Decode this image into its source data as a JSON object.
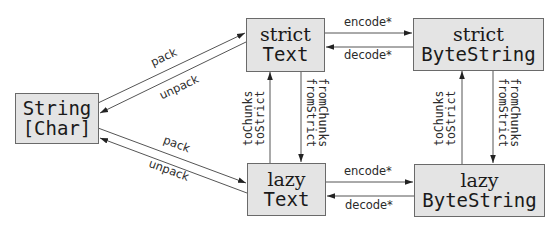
{
  "nodes": {
    "string_char": {
      "line1": "String",
      "line2": "[Char]"
    },
    "strict_text": {
      "line1": "strict",
      "line2": "Text"
    },
    "lazy_text": {
      "line1": "lazy",
      "line2": "Text"
    },
    "strict_bytestring": {
      "line1": "strict",
      "line2": "ByteString"
    },
    "lazy_bytestring": {
      "line1": "lazy",
      "line2": "ByteString"
    }
  },
  "edges": {
    "string_to_strict_text": "pack",
    "strict_text_to_string": "unpack",
    "string_to_lazy_text": "pack",
    "lazy_text_to_string": "unpack",
    "strict_text_to_strict_bs": "encode*",
    "strict_bs_to_strict_text": "decode*",
    "lazy_text_to_lazy_bs": "encode*",
    "lazy_bs_to_lazy_text": "decode*",
    "text_lazy_to_strict": {
      "line1": "toChunks",
      "line2": "toStrict"
    },
    "text_strict_to_lazy": {
      "line1": "fromChunks",
      "line2": "fromStrict"
    },
    "bs_lazy_to_strict": {
      "line1": "toChunks",
      "line2": "toStrict"
    },
    "bs_strict_to_lazy": {
      "line1": "fromChunks",
      "line2": "fromStrict"
    }
  }
}
